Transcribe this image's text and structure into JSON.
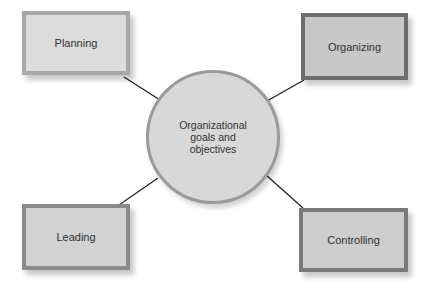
{
  "diagram": {
    "type": "hub-and-spoke",
    "center": {
      "label": "Organizational\ngoals and\nobjectives",
      "fill": "#d8d8d8",
      "border": "#9a9a9a"
    },
    "nodes": [
      {
        "id": "planning",
        "label": "Planning",
        "position": "top-left",
        "fill": "#dcdcdc",
        "border": "#a8a8a8"
      },
      {
        "id": "organizing",
        "label": "Organizing",
        "position": "top-right",
        "fill": "#c8c8c8",
        "border": "#6e6e6e"
      },
      {
        "id": "leading",
        "label": "Leading",
        "position": "bottom-left",
        "fill": "#d2d2d2",
        "border": "#8a8a8a"
      },
      {
        "id": "controlling",
        "label": "Controlling",
        "position": "bottom-right",
        "fill": "#cecece",
        "border": "#7a7a7a"
      }
    ],
    "connector_color": "#222222"
  }
}
